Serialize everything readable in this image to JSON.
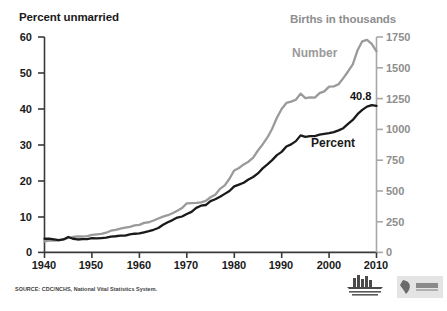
{
  "chart_data": {
    "type": "line",
    "title": "",
    "xlabel": "",
    "ylabel": "Percent unmarried",
    "y2label": "Births in thousands",
    "xlim": [
      1940,
      2010
    ],
    "ylim": [
      0,
      60
    ],
    "y2lim": [
      0,
      1750
    ],
    "grid": false,
    "legend_position": "inline-annotation",
    "xticks": [
      "1940",
      "1950",
      "1960",
      "1970",
      "1980",
      "1990",
      "2000",
      "2010"
    ],
    "yticks": [
      "0",
      "10",
      "20",
      "30",
      "40",
      "50",
      "60"
    ],
    "y2ticks": [
      "0",
      "250",
      "500",
      "750",
      "1000",
      "1250",
      "1500",
      "1750"
    ],
    "annotations": [
      {
        "text": "Number",
        "series": "Number",
        "color": "#9a9a9a"
      },
      {
        "text": "Percent",
        "series": "Percent",
        "color": "#1a1a1a"
      },
      {
        "text": "40.8",
        "series": "Percent",
        "color": "#111111"
      }
    ],
    "x": [
      1940,
      1941,
      1942,
      1943,
      1944,
      1945,
      1946,
      1947,
      1948,
      1949,
      1950,
      1951,
      1952,
      1953,
      1954,
      1955,
      1956,
      1957,
      1958,
      1959,
      1960,
      1961,
      1962,
      1963,
      1964,
      1965,
      1966,
      1967,
      1968,
      1969,
      1970,
      1971,
      1972,
      1973,
      1974,
      1975,
      1976,
      1977,
      1978,
      1979,
      1980,
      1981,
      1982,
      1983,
      1984,
      1985,
      1986,
      1987,
      1988,
      1989,
      1990,
      1991,
      1992,
      1993,
      1994,
      1995,
      1996,
      1997,
      1998,
      1999,
      2000,
      2001,
      2002,
      2003,
      2004,
      2005,
      2006,
      2007,
      2008,
      2009,
      2010
    ],
    "series": [
      {
        "name": "Percent",
        "axis": "left",
        "color": "#1a1a1a",
        "units": "percent of births to unmarried women",
        "values": [
          3.8,
          3.8,
          3.6,
          3.4,
          3.6,
          4.3,
          3.8,
          3.6,
          3.7,
          3.7,
          4.0,
          3.9,
          4.0,
          4.1,
          4.4,
          4.5,
          4.7,
          4.7,
          5.0,
          5.2,
          5.3,
          5.6,
          5.9,
          6.3,
          6.8,
          7.7,
          8.4,
          9.0,
          9.7,
          10.0,
          10.7,
          11.3,
          12.4,
          13.0,
          13.2,
          14.3,
          14.8,
          15.5,
          16.3,
          17.1,
          18.4,
          18.9,
          19.4,
          20.3,
          21.0,
          22.0,
          23.4,
          24.5,
          25.7,
          27.1,
          28.0,
          29.5,
          30.1,
          31.0,
          32.6,
          32.2,
          32.4,
          32.4,
          32.8,
          33.0,
          33.2,
          33.5,
          34.0,
          34.6,
          35.8,
          36.9,
          38.5,
          39.7,
          40.6,
          41.0,
          40.8
        ]
      },
      {
        "name": "Number",
        "axis": "right",
        "color": "#9a9a9a",
        "units": "births in thousands to unmarried women",
        "values": [
          89,
          95,
          96,
          98,
          105,
          118,
          125,
          131,
          129,
          133,
          142,
          146,
          150,
          160,
          176,
          183,
          193,
          201,
          208,
          220,
          224,
          240,
          245,
          259,
          275,
          291,
          302,
          318,
          339,
          360,
          399,
          401,
          403,
          407,
          418,
          448,
          468,
          516,
          544,
          598,
          666,
          686,
          715,
          737,
          770,
          828,
          878,
          934,
          1005,
          1094,
          1165,
          1214,
          1225,
          1240,
          1290,
          1254,
          1260,
          1257,
          1294,
          1308,
          1347,
          1349,
          1366,
          1416,
          1470,
          1527,
          1642,
          1715,
          1727,
          1694,
          1633
        ]
      }
    ]
  },
  "footer": {
    "source_note": "SOURCE: CDC/NCHS, National Vital Statistics System.",
    "nchs_logo_label": "National Center for Health Statistics",
    "cdc_logo_label": "CDC"
  }
}
